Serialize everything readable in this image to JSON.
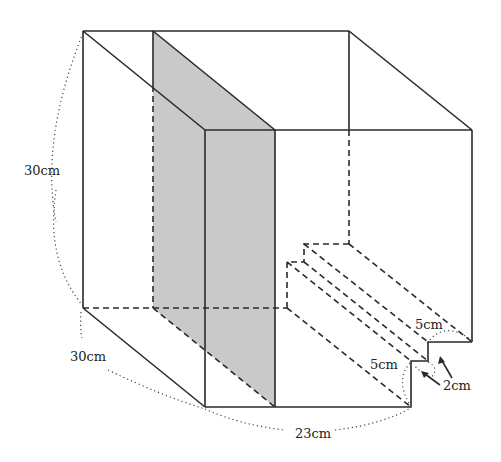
{
  "figure": {
    "colors": {
      "line": "#2a2a2a",
      "shade": "#c9c9c9",
      "background": "#ffffff"
    }
  },
  "labels": {
    "height": "30cm",
    "depth": "30cm",
    "width": "23cm",
    "step_upper": "5cm",
    "step_lower": "5cm",
    "step_rise": "2cm"
  }
}
